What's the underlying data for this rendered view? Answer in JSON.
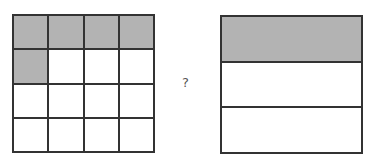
{
  "left_figure": {
    "type": "grid",
    "rows": 4,
    "cols": 4,
    "shaded_cells": [
      [
        0,
        0
      ],
      [
        0,
        1
      ],
      [
        0,
        2
      ],
      [
        0,
        3
      ],
      [
        1,
        0
      ]
    ],
    "shaded_count": 5,
    "total_cells": 16
  },
  "right_figure": {
    "type": "horizontal-bars",
    "rows": 3,
    "shaded_rows": [
      0
    ],
    "shaded_count": 1,
    "total_parts": 3
  },
  "comparison": {
    "symbol": "?"
  },
  "colors": {
    "shade": "#b3b3b3",
    "line": "#333333",
    "background": "#ffffff"
  }
}
